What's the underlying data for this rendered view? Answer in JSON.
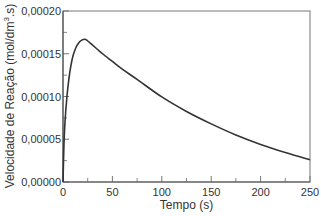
{
  "chart_data": {
    "type": "line",
    "title": "",
    "xlabel": "Tempo (s)",
    "ylabel": "Velocidade de Reação (mol/dm³.s)",
    "ylabel_parts": {
      "main": "Velocidade de Reação (mol/dm",
      "sup": "3",
      "tail": ".s)"
    },
    "xlim": [
      0,
      250
    ],
    "ylim": [
      0,
      0.0002
    ],
    "x_ticks": [
      0,
      50,
      100,
      150,
      200,
      250
    ],
    "x_tick_labels": [
      "0",
      "50",
      "100",
      "150",
      "200",
      "250"
    ],
    "x_minor_ticks": [
      25,
      75,
      125,
      175,
      225
    ],
    "y_ticks": [
      0,
      5e-05,
      0.0001,
      0.00015,
      0.0002
    ],
    "y_tick_labels": [
      "0,00000",
      "0,00005",
      "0,00010",
      "0,00015",
      "0,00020"
    ],
    "y_minor_ticks": [
      2.5e-05,
      7.5e-05,
      0.000125,
      0.000175
    ],
    "grid": false,
    "legend": null,
    "series": [
      {
        "name": "Velocidade de Reação",
        "color": "#333333",
        "x": [
          0,
          1,
          2,
          4,
          6,
          8,
          10,
          13,
          16,
          19,
          22,
          24,
          27,
          30,
          35,
          40,
          50,
          60,
          75,
          100,
          125,
          150,
          175,
          200,
          225,
          250
        ],
        "y": [
          0,
          4.5e-05,
          7e-05,
          0.0001,
          0.000121,
          0.000136,
          0.000147,
          0.000157,
          0.000163,
          0.000166,
          0.000167,
          0.000166,
          0.000163,
          0.00016,
          0.000155,
          0.00015,
          0.000141,
          0.000132,
          0.00012,
          9.95e-05,
          8.25e-05,
          6.8e-05,
          5.5e-05,
          4.4e-05,
          3.45e-05,
          2.6e-05
        ]
      }
    ]
  }
}
